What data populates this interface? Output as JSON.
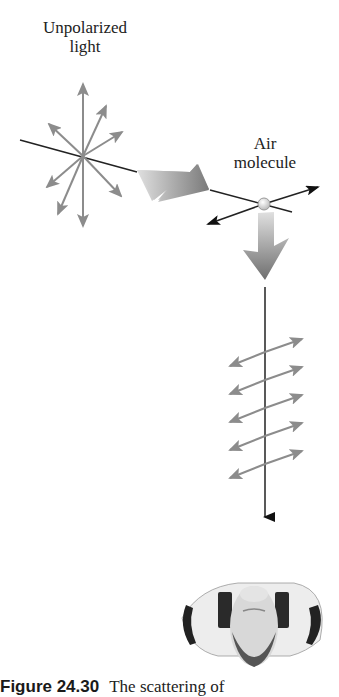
{
  "labels": {
    "unpolarized_line1": "Unpolarized",
    "unpolarized_line2": "light",
    "air_line1": "Air",
    "air_line2": "molecule"
  },
  "caption": {
    "figure_number": "Figure 24.30",
    "text": "The scattering of"
  },
  "colors": {
    "arrow_gray": "#8c8c8c",
    "line_dark": "#222222",
    "big_arrow_light": "#d9d9d9",
    "big_arrow_dark": "#7a7a7a",
    "molecule": "#e6e6e6"
  }
}
